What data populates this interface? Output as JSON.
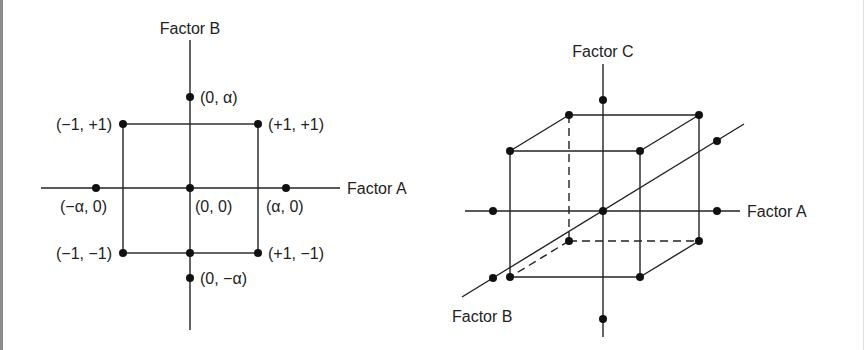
{
  "figure": {
    "colors": {
      "line": "#222222",
      "point": "#111111",
      "text": "#222222",
      "background": "#ffffff",
      "frame_left": "#8c8c8c"
    },
    "left_diagram": {
      "type": "central-composite-design-2-factor",
      "x_axis_label": "Factor A",
      "y_axis_label": "Factor B",
      "points": [
        {
          "id": "axial-top",
          "label": "(0, α)"
        },
        {
          "id": "corner-top-left",
          "label": "(−1, +1)"
        },
        {
          "id": "corner-top-right",
          "label": "(+1, +1)"
        },
        {
          "id": "axial-left",
          "label": "(−α, 0)"
        },
        {
          "id": "center",
          "label": "(0, 0)"
        },
        {
          "id": "axial-right",
          "label": "(α, 0)"
        },
        {
          "id": "corner-bottom-left",
          "label": "(−1, −1)"
        },
        {
          "id": "corner-bottom-right",
          "label": "(+1, −1)"
        },
        {
          "id": "axial-bottom",
          "label": "(0, −α)"
        }
      ]
    },
    "right_diagram": {
      "type": "central-composite-design-3-factor",
      "x_axis_label": "Factor A",
      "z_axis_label": "Factor C",
      "depth_axis_label": "Factor B"
    }
  }
}
